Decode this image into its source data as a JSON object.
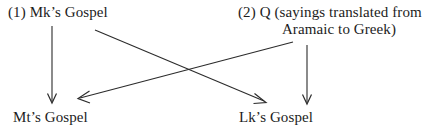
{
  "diagram": {
    "background_color": "#ffffff",
    "stroke_color": "#2b2b2b",
    "text_color": "#1c1c1c",
    "nodes": {
      "mk": {
        "label": "(1) Mk’s Gospel"
      },
      "q": {
        "label_line1": "(2) Q (sayings translated from",
        "label_line2": "Aramaic to Greek)"
      },
      "mt": {
        "label": "Mt’s Gospel"
      },
      "lk": {
        "label": "Lk’s Gospel"
      }
    },
    "edges": [
      {
        "name": "mk-to-mt",
        "from": "mk",
        "to": "mt",
        "style": "vertical-arrow"
      },
      {
        "name": "mk-to-lk",
        "from": "mk",
        "to": "lk",
        "style": "diagonal-arrow"
      },
      {
        "name": "q-to-mt",
        "from": "q",
        "to": "mt",
        "style": "diagonal-arrow"
      },
      {
        "name": "q-to-lk",
        "from": "q",
        "to": "lk",
        "style": "vertical-arrow"
      }
    ]
  }
}
